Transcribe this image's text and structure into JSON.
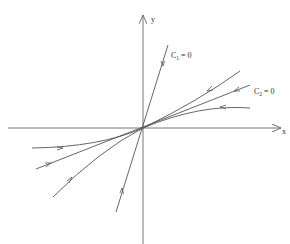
{
  "diagram": {
    "type": "phase-portrait",
    "axes": {
      "x_label": "x",
      "y_label": "y"
    },
    "lines": [
      {
        "id": "C1",
        "label_main": "C",
        "label_sub": "1",
        "label_rest": " = 0"
      },
      {
        "id": "C2",
        "label_main": "C",
        "label_sub": "2",
        "label_rest": " = 0"
      }
    ],
    "trajectories": 2,
    "flow_direction": "toward origin",
    "colors": {
      "line": "#555555",
      "axis": "#666666",
      "background": "#ffffff"
    }
  }
}
